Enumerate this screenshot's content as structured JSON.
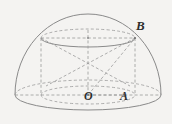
{
  "figure": {
    "kind": "solid-geometry-diagram",
    "background_color": "#f4f3f1",
    "stroke_color": "#8a8a8a",
    "hidden_stroke_color": "#9a9a9a",
    "label_color": "#2e2e2e",
    "labels": [
      {
        "id": "B",
        "text": "B",
        "x": 136,
        "y": 19
      },
      {
        "id": "O",
        "text": "O",
        "x": 84,
        "y": 90
      },
      {
        "id": "A",
        "text": "A",
        "x": 120,
        "y": 90
      }
    ],
    "geometry": {
      "hemisphere": {
        "center": {
          "x": 88,
          "y": 95
        },
        "radius_x": 73,
        "radius_y": 81,
        "base_ellipse_ry": 15
      },
      "cylinder": {
        "center_x": 88,
        "top_y": 38,
        "bottom_y": 95,
        "radius_x": 47,
        "radius_y": 9
      },
      "points": {
        "O": {
          "x": 88,
          "y": 95
        },
        "A": {
          "x": 124,
          "y": 95
        },
        "B": {
          "x": 134,
          "y": 37
        }
      }
    }
  }
}
